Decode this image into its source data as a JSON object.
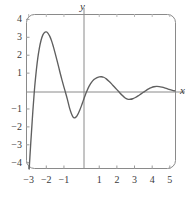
{
  "figure": {
    "kind": "cartesian-graph",
    "background_color": "#ffffff",
    "frame_color": "#8a8a8a",
    "axis_color": "#8a8a8a",
    "curve_color": "#5f5f5f",
    "text_color": "#3a3a3a",
    "axis_labels": {
      "x": "x",
      "y": "y"
    },
    "x_tick_labels": [
      "−3",
      "−2",
      "−1",
      "1",
      "2",
      "3",
      "4",
      "5"
    ],
    "y_tick_labels": [
      "4",
      "3",
      "2",
      "1",
      "−1",
      "−2",
      "−3",
      "−4"
    ]
  },
  "chart_data": {
    "type": "line",
    "title": "",
    "xlabel": "x",
    "ylabel": "y",
    "xlim": [
      -3.15,
      5.35
    ],
    "ylim": [
      -4.35,
      4.3
    ],
    "xticks": [
      -3,
      -2,
      -1,
      1,
      2,
      3,
      4,
      5
    ],
    "yticks": [
      4,
      3,
      2,
      1,
      -1,
      -2,
      -3,
      -4
    ],
    "grid": false,
    "legend": null,
    "series": [
      {
        "name": "curve",
        "color": "#5f5f5f",
        "points": [
          [
            -2.97,
            -4.35
          ],
          [
            -2.93,
            -3.7
          ],
          [
            -2.88,
            -2.9
          ],
          [
            -2.82,
            -2.0
          ],
          [
            -2.76,
            -1.1
          ],
          [
            -2.7,
            -0.3
          ],
          [
            -2.64,
            0.42
          ],
          [
            -2.56,
            1.2
          ],
          [
            -2.48,
            1.85
          ],
          [
            -2.4,
            2.36
          ],
          [
            -2.3,
            2.82
          ],
          [
            -2.2,
            3.12
          ],
          [
            -2.1,
            3.27
          ],
          [
            -2.0,
            3.3
          ],
          [
            -1.9,
            3.22
          ],
          [
            -1.8,
            3.05
          ],
          [
            -1.7,
            2.8
          ],
          [
            -1.6,
            2.48
          ],
          [
            -1.5,
            2.12
          ],
          [
            -1.4,
            1.74
          ],
          [
            -1.3,
            1.35
          ],
          [
            -1.2,
            0.95
          ],
          [
            -1.1,
            0.58
          ],
          [
            -1.0,
            0.22
          ],
          [
            -0.9,
            -0.12
          ],
          [
            -0.8,
            -0.48
          ],
          [
            -0.7,
            -0.88
          ],
          [
            -0.62,
            -1.14
          ],
          [
            -0.55,
            -1.32
          ],
          [
            -0.48,
            -1.45
          ],
          [
            -0.42,
            -1.5
          ],
          [
            -0.34,
            -1.47
          ],
          [
            -0.26,
            -1.38
          ],
          [
            -0.18,
            -1.24
          ],
          [
            -0.1,
            -1.06
          ],
          [
            0.0,
            -0.8
          ],
          [
            0.1,
            -0.52
          ],
          [
            0.2,
            -0.25
          ],
          [
            0.3,
            0.0
          ],
          [
            0.42,
            0.26
          ],
          [
            0.55,
            0.47
          ],
          [
            0.7,
            0.64
          ],
          [
            0.85,
            0.74
          ],
          [
            1.0,
            0.79
          ],
          [
            1.12,
            0.8
          ],
          [
            1.25,
            0.77
          ],
          [
            1.4,
            0.68
          ],
          [
            1.55,
            0.55
          ],
          [
            1.7,
            0.4
          ],
          [
            1.85,
            0.24
          ],
          [
            2.0,
            0.08
          ],
          [
            2.15,
            -0.08
          ],
          [
            2.3,
            -0.24
          ],
          [
            2.45,
            -0.37
          ],
          [
            2.6,
            -0.45
          ],
          [
            2.75,
            -0.46
          ],
          [
            2.9,
            -0.43
          ],
          [
            3.05,
            -0.36
          ],
          [
            3.2,
            -0.27
          ],
          [
            3.35,
            -0.17
          ],
          [
            3.5,
            -0.07
          ],
          [
            3.65,
            0.03
          ],
          [
            3.8,
            0.12
          ],
          [
            3.95,
            0.19
          ],
          [
            4.1,
            0.24
          ],
          [
            4.25,
            0.26
          ],
          [
            4.4,
            0.25
          ],
          [
            4.55,
            0.22
          ],
          [
            4.7,
            0.18
          ],
          [
            4.85,
            0.13
          ],
          [
            5.0,
            0.08
          ],
          [
            5.15,
            0.04
          ],
          [
            5.28,
            0.01
          ]
        ]
      }
    ]
  },
  "geometry": {
    "plot_left": 26,
    "plot_right": 176,
    "plot_top": 14,
    "plot_bottom": 169,
    "x_zero_px": 84,
    "y_zero_px": 92
  }
}
